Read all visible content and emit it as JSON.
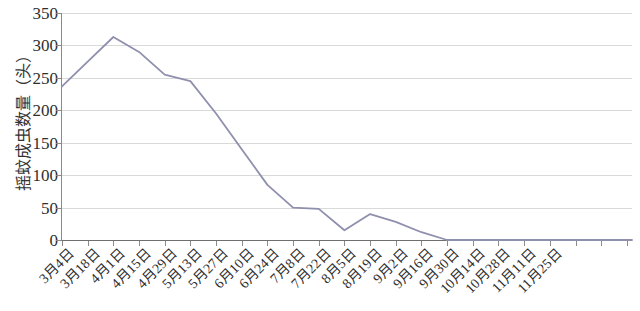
{
  "chart_data": {
    "type": "line",
    "title": "",
    "xlabel": "",
    "ylabel": "摇蚊成虫数量（头）",
    "ylim": [
      0,
      350
    ],
    "ytick_labels": [
      "350",
      "300",
      "250",
      "200",
      "150",
      "100",
      "50",
      "0"
    ],
    "ytick_values": [
      350,
      300,
      250,
      200,
      150,
      100,
      50,
      0
    ],
    "grid": true,
    "legend": "none",
    "categories": [
      "3月4日",
      "3月18日",
      "4月1日",
      "4月15日",
      "4月29日",
      "5月13日",
      "5月27日",
      "6月10日",
      "6月24日",
      "7月8日",
      "7月22日",
      "8月5日",
      "8月19日",
      "9月2日",
      "9月16日",
      "9月30日",
      "10月14日",
      "10月28日",
      "11月11日",
      "11月25日"
    ],
    "series": [
      {
        "name": "摇蚊成虫数量",
        "color": "#8f8fae",
        "values": [
          237,
          275,
          313,
          290,
          255,
          245,
          195,
          140,
          85,
          50,
          48,
          15,
          40,
          28,
          12,
          0,
          0,
          0,
          0,
          0
        ]
      }
    ]
  },
  "axis": {
    "y_title": "摇蚊成虫数量（头）"
  },
  "colors": {
    "line": "#8f8fae",
    "grid": "#d9d9d9",
    "axis": "#8a8a8a",
    "text": "#2e2e2e",
    "background": "#ffffff"
  }
}
